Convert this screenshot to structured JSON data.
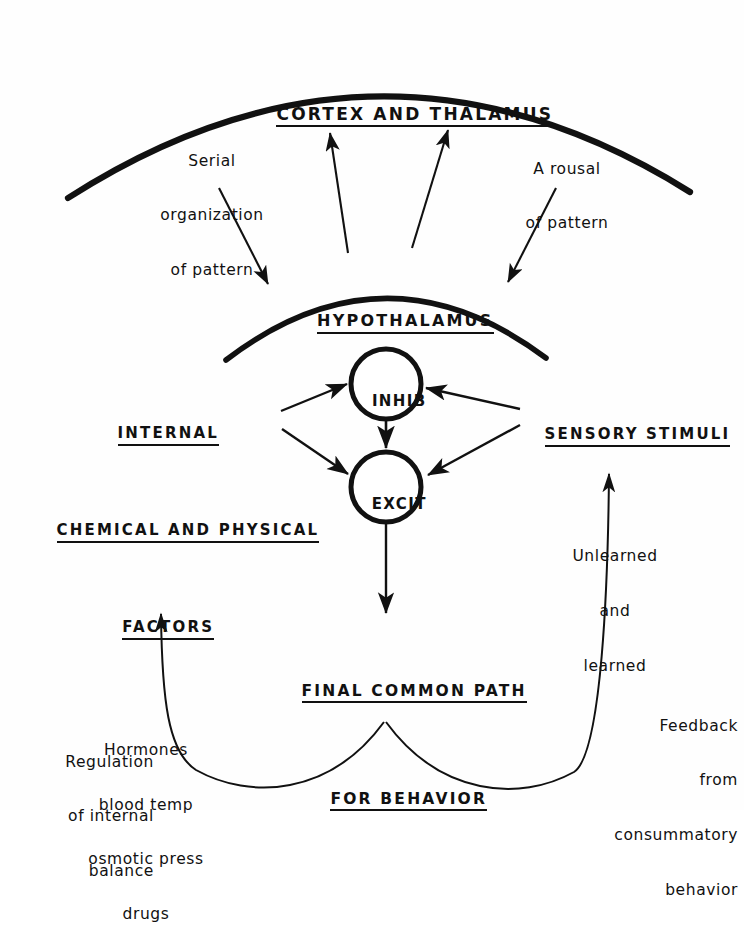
{
  "figure": {
    "type": "conceptual-flow-diagram"
  },
  "arcs": {
    "cortex_label": "CORTEX AND THALAMUS",
    "hypothalamus_label": "HYPOTHALAMUS"
  },
  "nodes": {
    "inhib": "INHIB",
    "excit": "EXCIT"
  },
  "labels": {
    "serial_organization": {
      "line1": "Serial",
      "line2": "organization",
      "line3": "of pattern"
    },
    "arousal": {
      "line1": "A rousal",
      "line2": "of pattern"
    },
    "internal_factors": {
      "line1": "INTERNAL",
      "line2": "CHEMICAL AND PHYSICAL",
      "line3": "FACTORS",
      "items": [
        "Hormones",
        "blood temp",
        "osmotic press",
        "drugs"
      ]
    },
    "sensory_stimuli": {
      "heading": "SENSORY STIMULI",
      "line1": "Unlearned",
      "line2": "and",
      "line3": "learned"
    },
    "final_common_path": {
      "line1": "FINAL COMMON PATH",
      "line2": "FOR BEHAVIOR"
    },
    "regulation": {
      "line1": "Regulation",
      "line2": "of internal",
      "line3": "balance"
    },
    "feedback": {
      "line1": "Feedback",
      "line2": "from",
      "line3": "consummatory",
      "line4": "behavior"
    }
  },
  "colors": {
    "ink": "#111111",
    "paper": "#fefefe"
  }
}
